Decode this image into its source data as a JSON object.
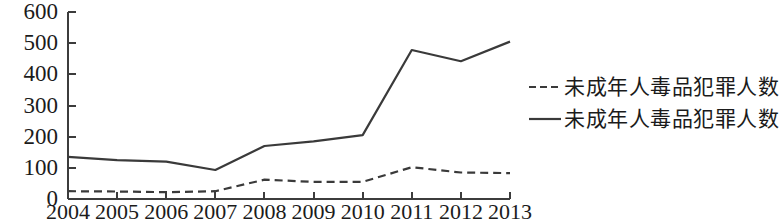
{
  "chart_data": {
    "type": "line",
    "title": "",
    "xlabel": "",
    "ylabel": "",
    "categories": [
      "2004",
      "2005",
      "2006",
      "2007",
      "2008",
      "2009",
      "2010",
      "2011",
      "2012",
      "2013"
    ],
    "series": [
      {
        "name": "未成年人毒品犯罪人数",
        "style": "dashed",
        "color": "#3a3a3a",
        "values": [
          25,
          24,
          22,
          25,
          62,
          55,
          55,
          102,
          85,
          83
        ]
      },
      {
        "name": "未成年人毒品犯罪人数",
        "style": "solid",
        "color": "#3a3a3a",
        "values": [
          135,
          125,
          120,
          93,
          170,
          185,
          205,
          478,
          442,
          505
        ]
      }
    ],
    "ylim": [
      0,
      600
    ],
    "yticks": [
      0,
      100,
      200,
      300,
      400,
      500,
      600
    ],
    "ytick_labels": [
      "0",
      "100",
      "200",
      "300",
      "400",
      "500",
      "600"
    ],
    "grid": false,
    "legend_position": "right"
  },
  "legend": {
    "entries": [
      {
        "label": "未成年人毒品犯罪人数",
        "marker": "dashed-line-marker"
      },
      {
        "label": "未成年人毒品犯罪人数",
        "marker": "solid-line-marker"
      }
    ]
  }
}
